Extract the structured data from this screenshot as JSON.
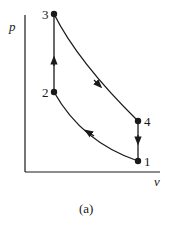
{
  "figure": {
    "caption": "(a)",
    "axes": {
      "x_label": "v",
      "y_label": "p"
    },
    "states": [
      {
        "id": "1",
        "label": "1"
      },
      {
        "id": "2",
        "label": "2"
      },
      {
        "id": "3",
        "label": "3"
      },
      {
        "id": "4",
        "label": "4"
      }
    ],
    "processes": [
      {
        "from": "1",
        "to": "2",
        "type": "compression curve"
      },
      {
        "from": "2",
        "to": "3",
        "type": "constant volume heat addition"
      },
      {
        "from": "3",
        "to": "4",
        "type": "expansion curve"
      },
      {
        "from": "4",
        "to": "1",
        "type": "constant volume heat rejection"
      }
    ],
    "colors": {
      "line": "#1a1a1a",
      "background": "#ffffff"
    }
  }
}
